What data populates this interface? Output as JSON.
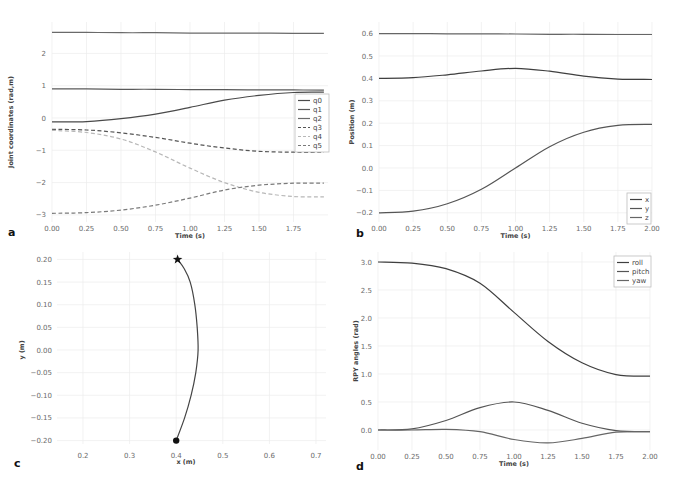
{
  "figure": {
    "panels": [
      "a",
      "b",
      "c",
      "d"
    ]
  },
  "chart_data": [
    {
      "panel": "a",
      "type": "line",
      "title": "",
      "xlabel": "Time (s)",
      "ylabel": "Joint coordinates (rad,m)",
      "xlim": [
        0.0,
        1.97
      ],
      "ylim": [
        -3.15,
        2.95
      ],
      "xticks": [
        "0.00",
        "0.25",
        "0.50",
        "0.75",
        "1.00",
        "1.25",
        "1.50",
        "1.75"
      ],
      "xtick_values": [
        0,
        0.25,
        0.5,
        0.75,
        1.0,
        1.25,
        1.5,
        1.75
      ],
      "yticks": [
        "−3",
        "−2",
        "−1",
        "0",
        "1",
        "2"
      ],
      "ytick_values": [
        -3,
        -2,
        -1,
        0,
        1,
        2
      ],
      "grid": true,
      "legend_position": "right-middle",
      "x": [
        0.0,
        0.25,
        0.5,
        0.75,
        1.0,
        1.25,
        1.5,
        1.75,
        1.97
      ],
      "series": [
        {
          "name": "q0",
          "style": "solid",
          "color": "#4a4a4a",
          "values": [
            -0.12,
            -0.11,
            -0.02,
            0.12,
            0.33,
            0.55,
            0.7,
            0.79,
            0.8
          ]
        },
        {
          "name": "q1",
          "style": "solid",
          "color": "#5a5a5a",
          "values": [
            0.9,
            0.9,
            0.89,
            0.89,
            0.88,
            0.88,
            0.87,
            0.87,
            0.86
          ]
        },
        {
          "name": "q2",
          "style": "solid",
          "color": "#6a6a6a",
          "values": [
            2.65,
            2.65,
            2.64,
            2.64,
            2.63,
            2.63,
            2.63,
            2.62,
            2.62
          ]
        },
        {
          "name": "q3",
          "style": "dashed",
          "color": "#555555",
          "values": [
            -0.35,
            -0.37,
            -0.46,
            -0.6,
            -0.78,
            -0.93,
            -1.03,
            -1.06,
            -1.06
          ]
        },
        {
          "name": "q4",
          "style": "dashed",
          "color": "#b8b8b8",
          "values": [
            -0.38,
            -0.45,
            -0.65,
            -1.05,
            -1.55,
            -2.0,
            -2.3,
            -2.43,
            -2.44
          ]
        },
        {
          "name": "q5",
          "style": "dashed",
          "color": "#7a7a7a",
          "values": [
            -2.95,
            -2.93,
            -2.85,
            -2.7,
            -2.48,
            -2.23,
            -2.08,
            -2.02,
            -2.02
          ]
        }
      ]
    },
    {
      "panel": "b",
      "type": "line",
      "title": "",
      "xlabel": "Time (s)",
      "ylabel": "Position (m)",
      "xlim": [
        0.0,
        2.0
      ],
      "ylim": [
        -0.22,
        0.62
      ],
      "xticks": [
        "0.00",
        "0.25",
        "0.50",
        "0.75",
        "1.00",
        "1.25",
        "1.50",
        "1.75",
        "2.00"
      ],
      "xtick_values": [
        0,
        0.25,
        0.5,
        0.75,
        1.0,
        1.25,
        1.5,
        1.75,
        2.0
      ],
      "yticks": [
        "−0.2",
        "−0.1",
        "0.0",
        "0.1",
        "0.2",
        "0.3",
        "0.4",
        "0.5",
        "0.6"
      ],
      "ytick_values": [
        -0.2,
        -0.1,
        0.0,
        0.1,
        0.2,
        0.3,
        0.4,
        0.5,
        0.6
      ],
      "grid": true,
      "legend_position": "lower right",
      "x": [
        0.0,
        0.25,
        0.5,
        0.75,
        1.0,
        1.25,
        1.5,
        1.75,
        2.0
      ],
      "series": [
        {
          "name": "x",
          "color": "#3f3f3f",
          "values": [
            0.4,
            0.403,
            0.416,
            0.433,
            0.445,
            0.432,
            0.41,
            0.397,
            0.395
          ]
        },
        {
          "name": "y",
          "color": "#555555",
          "values": [
            -0.2,
            -0.193,
            -0.16,
            -0.095,
            0.0,
            0.095,
            0.16,
            0.19,
            0.195
          ]
        },
        {
          "name": "z",
          "color": "#666666",
          "values": [
            0.6,
            0.6,
            0.599,
            0.599,
            0.598,
            0.597,
            0.597,
            0.596,
            0.596
          ]
        }
      ]
    },
    {
      "panel": "c",
      "type": "line",
      "title": "",
      "xlabel": "x (m)",
      "ylabel": "y (m)",
      "xlim": [
        0.12,
        0.72
      ],
      "ylim": [
        -0.215,
        0.215
      ],
      "xticks": [
        "0.2",
        "0.3",
        "0.4",
        "0.5",
        "0.6",
        "0.7"
      ],
      "xtick_values": [
        0.2,
        0.3,
        0.4,
        0.5,
        0.6,
        0.7
      ],
      "yticks": [
        "−0.20",
        "−0.15",
        "−0.10",
        "−0.05",
        "0.00",
        "0.05",
        "0.10",
        "0.15",
        "0.20"
      ],
      "ytick_values": [
        -0.2,
        -0.15,
        -0.1,
        -0.05,
        0.0,
        0.05,
        0.1,
        0.15,
        0.2
      ],
      "grid": true,
      "series": [
        {
          "name": "path",
          "color": "#444444",
          "x": [
            0.4,
            0.418,
            0.432,
            0.442,
            0.447,
            0.445,
            0.44,
            0.43,
            0.417,
            0.403
          ],
          "y": [
            -0.2,
            -0.15,
            -0.1,
            -0.05,
            0.0,
            0.05,
            0.1,
            0.15,
            0.18,
            0.2
          ]
        }
      ],
      "markers": [
        {
          "name": "start",
          "shape": "circle",
          "x": 0.4,
          "y": -0.2
        },
        {
          "name": "goal",
          "shape": "star",
          "x": 0.403,
          "y": 0.2
        }
      ]
    },
    {
      "panel": "d",
      "type": "line",
      "title": "",
      "xlabel": "Time (s)",
      "ylabel": "RPY angles (rad)",
      "xlim": [
        0.0,
        2.0
      ],
      "ylim": [
        -0.3,
        3.1
      ],
      "xticks": [
        "0.00",
        "0.25",
        "0.50",
        "0.75",
        "1.00",
        "1.25",
        "1.50",
        "1.75",
        "2.00"
      ],
      "xtick_values": [
        0,
        0.25,
        0.5,
        0.75,
        1.0,
        1.25,
        1.5,
        1.75,
        2.0
      ],
      "yticks": [
        "0.0",
        "0.5",
        "1.0",
        "1.5",
        "2.0",
        "2.5",
        "3.0"
      ],
      "ytick_values": [
        0.0,
        0.5,
        1.0,
        1.5,
        2.0,
        2.5,
        3.0
      ],
      "grid": true,
      "legend_position": "upper right",
      "x": [
        0.0,
        0.25,
        0.5,
        0.75,
        1.0,
        1.25,
        1.5,
        1.75,
        2.0
      ],
      "series": [
        {
          "name": "roll",
          "color": "#3f3f3f",
          "values": [
            3.0,
            2.98,
            2.88,
            2.62,
            2.1,
            1.58,
            1.2,
            0.99,
            0.96
          ]
        },
        {
          "name": "pitch",
          "color": "#555555",
          "values": [
            0.0,
            0.02,
            0.17,
            0.4,
            0.5,
            0.35,
            0.12,
            -0.01,
            -0.03
          ]
        },
        {
          "name": "yaw",
          "color": "#666666",
          "values": [
            0.0,
            0.0,
            0.01,
            -0.03,
            -0.17,
            -0.23,
            -0.15,
            -0.04,
            -0.03
          ]
        }
      ]
    }
  ],
  "layout": {
    "a": {
      "x0": 52,
      "x1": 328,
      "y0": 22,
      "y1": 222,
      "tx0": 52,
      "tpx": 138.0,
      "vy0": 118,
      "vpy": 32.3
    },
    "b": {
      "x0": 379,
      "x1": 652,
      "y0": 22,
      "y1": 222,
      "tx0": 379,
      "tpx": 136.5,
      "vy0": 168,
      "vpy": 224.0
    },
    "c": {
      "x0": 52,
      "x1": 326,
      "y0": 252,
      "y1": 450,
      "cx": 0.2,
      "cxpx": 83,
      "cpx": 466.0,
      "vy0": 350,
      "vpy": 453.0
    },
    "d": {
      "x0": 378,
      "x1": 650,
      "y0": 252,
      "y1": 450,
      "tx0": 378,
      "tpx": 136.0,
      "vy0": 430,
      "vpy": 56.0
    }
  }
}
